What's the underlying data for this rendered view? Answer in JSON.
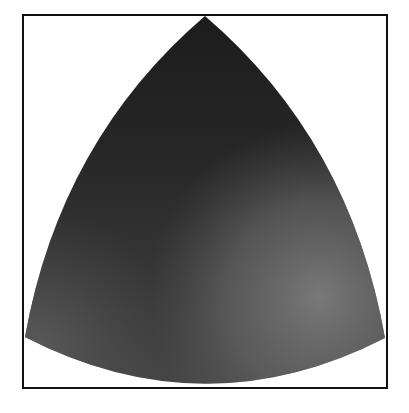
{
  "figure": {
    "frame": {
      "x": 23,
      "y": 15,
      "width": 364,
      "height": 373,
      "stroke": "#111111",
      "stroke_width": 2
    },
    "shape": {
      "apex": [
        205,
        16
      ],
      "bottom_left": [
        25,
        337
      ],
      "bottom_right": [
        385,
        338
      ],
      "bottom_low_point_y": 388
    },
    "colors": {
      "top": "#1b1b1b",
      "upper_middle": "#262626",
      "center": "#333333",
      "lower_left": "#575757",
      "right_lower": "#727272",
      "bottom_right": "#7c7c7c",
      "background": "#ffffff"
    }
  }
}
